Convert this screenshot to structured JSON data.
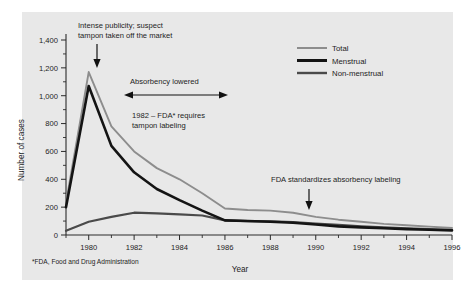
{
  "figure": {
    "background_color": "#e8e8e8",
    "page_color": "#ffffff",
    "footnote": "*FDA, Food and Drug Administration"
  },
  "legend": {
    "position": "top-right",
    "entries": [
      {
        "label": "Total",
        "color": "#8d8d8d",
        "width": 2.0
      },
      {
        "label": "Menstrual",
        "color": "#141414",
        "width": 3.0
      },
      {
        "label": "Non-menstrual",
        "color": "#4a4a4a",
        "width": 2.4
      }
    ]
  },
  "annotations": {
    "peak": {
      "line1": "Intense publicity; suspect",
      "line2": "tampon taken off the market"
    },
    "absorbency": {
      "label": "Absorbency lowered"
    },
    "fda1982": {
      "line1": "1982 – FDA* requires",
      "line2": "tampon labeling"
    },
    "fda1990": {
      "label": "FDA standardizes absorbency labeling"
    }
  },
  "chart_data": {
    "type": "line",
    "title": "",
    "xlabel": "Year",
    "ylabel": "Number of cases",
    "xlim": [
      1979,
      1996
    ],
    "ylim": [
      0,
      1400
    ],
    "yticks": [
      0,
      200,
      400,
      600,
      800,
      1000,
      1200,
      1400
    ],
    "ytick_labels": [
      "0",
      "200",
      "400",
      "600",
      "800",
      "1,000",
      "1,200",
      "1,400"
    ],
    "ytick_minor_step": 100,
    "xticks": [
      1980,
      1982,
      1984,
      1986,
      1988,
      1990,
      1992,
      1994,
      1996
    ],
    "xtick_labels": [
      "1980",
      "1982",
      "1984",
      "1986",
      "1988",
      "1990",
      "1992",
      "1994",
      "1996"
    ],
    "xtick_minor": [
      1979,
      1981,
      1983,
      1985,
      1987,
      1989,
      1991,
      1993,
      1995
    ],
    "grid": false,
    "legend_position": "top-right",
    "x": [
      1979,
      1980,
      1981,
      1982,
      1983,
      1984,
      1985,
      1986,
      1987,
      1988,
      1989,
      1990,
      1991,
      1992,
      1993,
      1994,
      1995,
      1996
    ],
    "series": [
      {
        "name": "Total",
        "color": "#8d8d8d",
        "values": [
          230,
          1170,
          780,
          600,
          480,
          400,
          300,
          190,
          180,
          175,
          160,
          130,
          110,
          95,
          80,
          70,
          60,
          50
        ]
      },
      {
        "name": "Menstrual",
        "color": "#141414",
        "values": [
          200,
          1070,
          640,
          450,
          330,
          250,
          175,
          105,
          100,
          95,
          88,
          75,
          62,
          55,
          48,
          42,
          38,
          33
        ]
      },
      {
        "name": "Non-menstrual",
        "color": "#4a4a4a",
        "values": [
          30,
          95,
          130,
          160,
          155,
          148,
          140,
          105,
          100,
          98,
          92,
          82,
          72,
          62,
          55,
          48,
          42,
          36
        ]
      }
    ]
  }
}
